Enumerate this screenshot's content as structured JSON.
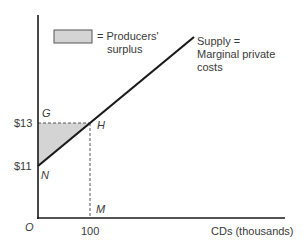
{
  "diagram": {
    "legend": {
      "swatch_color": "#d4d4d4",
      "label_line1": "= Producers'",
      "label_line2": "surplus"
    },
    "supply_label": {
      "line1": "Supply =",
      "line2": "Marginal private",
      "line3": "costs"
    },
    "axes": {
      "origin_label": "O",
      "x_label": "CDs (thousands)",
      "x_ticks": [
        "100"
      ],
      "y_ticks": [
        "$13",
        "$11"
      ]
    },
    "points": {
      "G": "G",
      "H": "H",
      "N": "N",
      "M": "M"
    },
    "colors": {
      "line": "#1a1a1a",
      "shade": "#d4d4d4",
      "dash": "#555555"
    }
  }
}
